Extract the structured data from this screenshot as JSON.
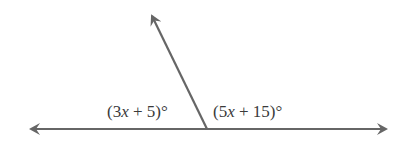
{
  "diagram": {
    "type": "linear-pair-angles",
    "line_color": "#666666",
    "text_color": "#3a3a3a",
    "horizontal_line": {
      "x1": 30,
      "y1": 129,
      "x2": 388,
      "y2": 129,
      "arrows": [
        "left",
        "right"
      ]
    },
    "ray": {
      "x1": 207,
      "y1": 129,
      "x2": 151,
      "y2": 14,
      "arrow": "end"
    },
    "angles": [
      {
        "label_prefix": "(3",
        "variable": "x",
        "label_suffix": " + 5)°",
        "full_label": "(3x + 5)°",
        "position": "left"
      },
      {
        "label_prefix": "(5",
        "variable": "x",
        "label_suffix": " + 15)°",
        "full_label": "(5x + 15)°",
        "position": "right"
      }
    ]
  }
}
